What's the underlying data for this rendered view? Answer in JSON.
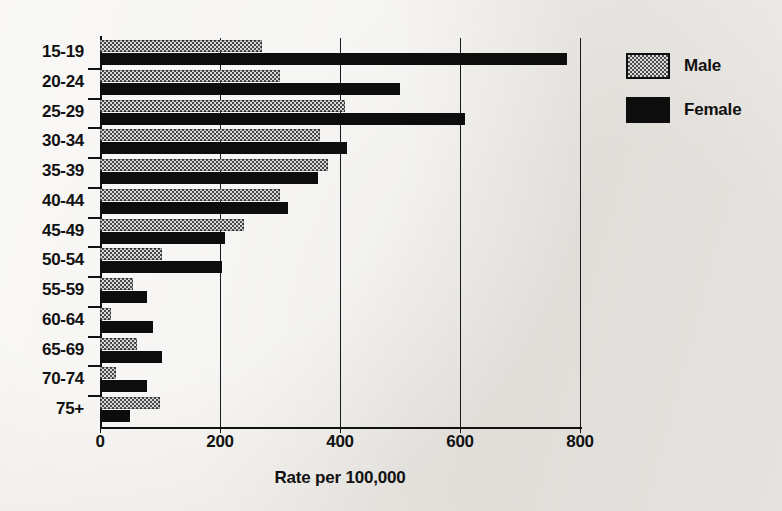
{
  "chart_data": {
    "type": "bar",
    "orientation": "horizontal",
    "title": "",
    "xlabel": "Rate per 100,000",
    "ylabel": "",
    "xlim": [
      0,
      800
    ],
    "xticks": [
      0,
      200,
      400,
      600,
      800
    ],
    "xtick_labels": [
      "0",
      "200",
      "400",
      "600",
      "800"
    ],
    "grid": true,
    "grid_axis": "x",
    "legend_position": "right",
    "categories": [
      "15-19",
      "20-24",
      "25-29",
      "30-34",
      "35-39",
      "40-44",
      "45-49",
      "50-54",
      "55-59",
      "60-64",
      "65-69",
      "70-74",
      "75+"
    ],
    "series": [
      {
        "name": "Male",
        "color": "#808080",
        "pattern": "checker-dither",
        "values": [
          270,
          300,
          408,
          367,
          380,
          300,
          240,
          103,
          55,
          18,
          62,
          27,
          100
        ]
      },
      {
        "name": "Female",
        "color": "#0d0d0d",
        "pattern": "solid",
        "values": [
          778,
          500,
          608,
          412,
          363,
          313,
          208,
          203,
          78,
          88,
          103,
          78,
          50
        ]
      }
    ]
  },
  "legend": {
    "items": [
      {
        "label": "Male",
        "swatch": "male-swatch"
      },
      {
        "label": "Female",
        "swatch": "female-swatch"
      }
    ]
  }
}
